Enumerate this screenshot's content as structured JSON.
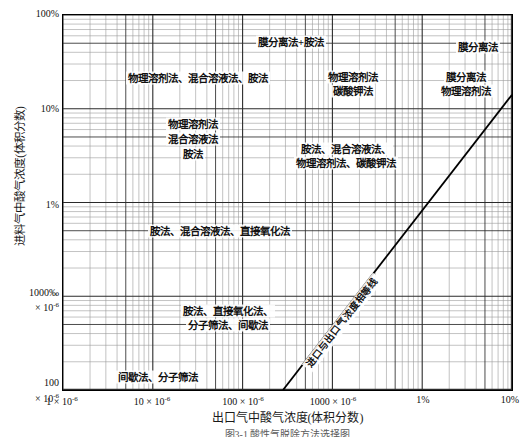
{
  "figure": {
    "caption": "图3-1  酸性气脱除方法选择图",
    "xlabel": "出口气中酸气浓度(体积分数)",
    "ylabel": "进料气中酸气浓度(体积分数)"
  },
  "axes": {
    "x_ticks": [
      {
        "label": "1 × 10",
        "exp": "-6",
        "pos": 0
      },
      {
        "label": "10 × 10",
        "exp": "-6",
        "pos": 1
      },
      {
        "label": "100 × 10",
        "exp": "-6",
        "pos": 2
      },
      {
        "label": "1000 × 10",
        "exp": "-6",
        "pos": 3
      },
      {
        "label": "1%",
        "exp": "",
        "pos": 4
      },
      {
        "label": "10%",
        "exp": "",
        "pos": 5
      }
    ],
    "y_ticks": [
      {
        "label": "100%",
        "exp": "",
        "pos": 0
      },
      {
        "label": "10%",
        "exp": "",
        "pos": 1
      },
      {
        "label": "1%",
        "exp": "",
        "pos": 2
      },
      {
        "label": "1000‰",
        "line2": "× 10",
        "exp": "-6",
        "pos": 3
      },
      {
        "label": "100",
        "line2": "× 10",
        "exp": "-6",
        "pos": 4
      }
    ],
    "x_label_0": "1 × 10",
    "x_label_1": "10 × 10",
    "x_label_2": "100 × 10",
    "x_label_3": "1000 × 10",
    "x_label_4": "1%",
    "x_label_5": "10%",
    "y_label_0": "100%",
    "y_label_1": "10%",
    "y_label_2": "1%",
    "y_label_3a": "1000‰",
    "y_label_3b": "× 10",
    "y_label_4a": "100",
    "y_label_4b": "× 10",
    "exponent": "-6",
    "grid": "log-log minor grid, both axes"
  },
  "regions": [
    {
      "id": "membrane-plus-amine",
      "text": "膜分离法+胺法"
    },
    {
      "id": "membrane",
      "text": "膜分离法"
    },
    {
      "id": "physical-mixed-amine",
      "text": "物理溶剂法、混合溶液法、胺法"
    },
    {
      "id": "physical-potash-l1",
      "text": "物理溶剂法"
    },
    {
      "id": "physical-potash-l2",
      "text": "碳酸钾法"
    },
    {
      "id": "membrane-physical-l1",
      "text": "膜分离法"
    },
    {
      "id": "membrane-physical-l2",
      "text": "物理溶剂法"
    },
    {
      "id": "phys-mix-amine-l1",
      "text": "物理溶剂法"
    },
    {
      "id": "phys-mix-amine-l2",
      "text": "混合溶液法"
    },
    {
      "id": "phys-mix-amine-l3",
      "text": "胺法"
    },
    {
      "id": "amine-mixed-physical-potash-l1",
      "text": "胺法、混合溶液法、"
    },
    {
      "id": "amine-mixed-physical-potash-l2",
      "text": "物理溶剂法、碳酸钾法"
    },
    {
      "id": "amine-mixed-directox",
      "text": "胺法、混合溶液法、直接氧化法"
    },
    {
      "id": "amine-directox-sieve-batch-l1",
      "text": "胺法、直接氧化法、"
    },
    {
      "id": "amine-directox-sieve-batch-l2",
      "text": "分子筛法、间歇法"
    },
    {
      "id": "batch-sieve",
      "text": "间歇法、分子筛法"
    }
  ],
  "parity_line": {
    "label": "进口与出口气浓度相等线",
    "color": "#000000"
  },
  "colors": {
    "grid_major": "#2b2b2b",
    "grid_minor": "#9a9a9a",
    "frame": "#000000",
    "text": "#111111",
    "background": "#ffffff"
  }
}
